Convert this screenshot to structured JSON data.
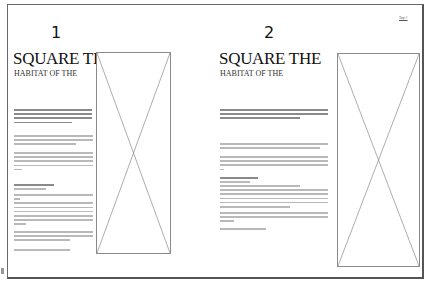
{
  "document": {
    "pages": [
      {
        "number": "1",
        "title": "SQUARE THE",
        "subtitle": "HABITAT OF THE",
        "has_image_placeholder": true
      },
      {
        "number": "2",
        "title": "SQUARE THE",
        "subtitle": "HABITAT OF THE",
        "has_image_placeholder": true,
        "corner_tag": "Top #"
      }
    ]
  }
}
